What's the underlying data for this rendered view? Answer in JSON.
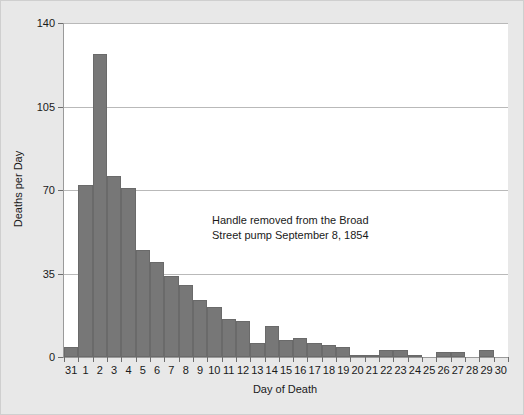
{
  "chart_data": {
    "type": "bar",
    "title": "",
    "xlabel": "Day of Death",
    "ylabel": "Deaths per Day",
    "categories": [
      "31",
      "1",
      "2",
      "3",
      "4",
      "5",
      "6",
      "7",
      "8",
      "9",
      "10",
      "11",
      "12",
      "13",
      "14",
      "15",
      "16",
      "17",
      "18",
      "19",
      "20",
      "21",
      "22",
      "23",
      "24",
      "25",
      "26",
      "27",
      "28",
      "29",
      "30"
    ],
    "values": [
      4,
      72,
      127,
      76,
      71,
      45,
      40,
      34,
      30,
      24,
      21,
      16,
      15,
      6,
      13,
      7,
      8,
      6,
      5,
      4,
      1,
      1,
      3,
      3,
      1,
      0,
      2,
      2,
      0,
      3,
      0
    ],
    "ylim": [
      0,
      140
    ],
    "yticks": [
      "0",
      "35",
      "70",
      "105",
      "140"
    ],
    "ytick_values": [
      0,
      35,
      70,
      105,
      140
    ],
    "grid": true,
    "legend": "none",
    "bar_color": "#777777",
    "annotations": [
      {
        "line1": "Handle removed from the Broad",
        "line2": "Street pump September 8, 1854"
      }
    ]
  }
}
